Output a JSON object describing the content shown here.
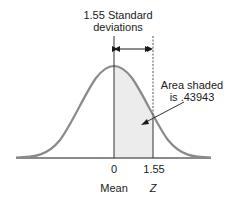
{
  "figure": {
    "title_line1": "1.55 Standard",
    "title_line2": "deviations",
    "annotation_line1": "Area shaded",
    "annotation_line2": "is .43943",
    "tick_labels": [
      "0",
      "1.55"
    ],
    "axis_labels": {
      "mean": "Mean",
      "z": "Z"
    },
    "colors": {
      "curve": "#8a8a8a",
      "shade": "#ececec",
      "line": "#333333",
      "baseline": "#8a8a8a"
    }
  }
}
